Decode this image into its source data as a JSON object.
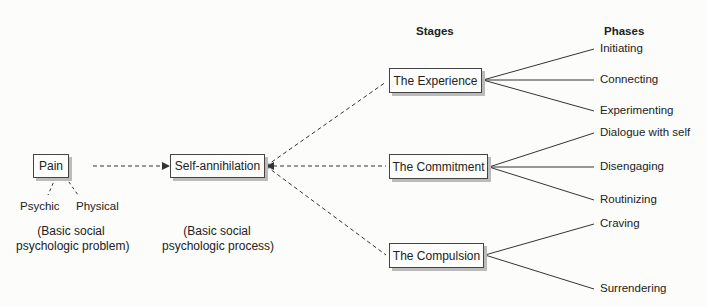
{
  "headers": {
    "stages": "Stages",
    "phases": "Phases"
  },
  "problem": {
    "label": "Pain",
    "sub": [
      "Psychic",
      "Physical"
    ],
    "caption_line1": "(Basic social",
    "caption_line2": "psychologic problem)"
  },
  "process": {
    "label": "Self-annihilation",
    "caption_line1": "(Basic social",
    "caption_line2": "psychologic process)"
  },
  "stages": [
    {
      "label": "The Experience",
      "phases": [
        "Initiating",
        "Connecting",
        "Experimenting"
      ]
    },
    {
      "label": "The Commitment",
      "phases": [
        "Dialogue with self",
        "Disengaging",
        "Routinizing"
      ]
    },
    {
      "label": "The Compulsion",
      "phases": [
        "Craving",
        "Surrendering"
      ]
    }
  ]
}
